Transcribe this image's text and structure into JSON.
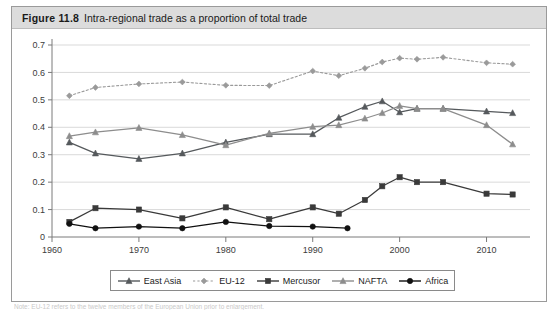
{
  "figure": {
    "label": "Figure 11.8",
    "caption": "Intra-regional trade as a proportion of total trade",
    "footnote": "Note: EU-12 refers to the twelve members of the European Union prior to enlargement."
  },
  "legend": {
    "position": "bottom-center",
    "entries": [
      {
        "label": "East Asia",
        "color": "#55595c",
        "marker": "triangle",
        "dashed": false
      },
      {
        "label": "EU-12",
        "color": "#9a9a9a",
        "marker": "diamond",
        "dashed": true
      },
      {
        "label": "Mercusor",
        "color": "#3a3a3a",
        "marker": "square",
        "dashed": false
      },
      {
        "label": "NAFTA",
        "color": "#8d8d8d",
        "marker": "triangle",
        "dashed": false
      },
      {
        "label": "Africa",
        "color": "#111111",
        "marker": "circle",
        "dashed": false
      }
    ]
  },
  "chart_data": {
    "type": "line",
    "title": "Intra-regional trade as a proportion of total trade",
    "xlabel": "",
    "ylabel": "",
    "xlim": [
      1960,
      2015
    ],
    "ylim": [
      0,
      0.7
    ],
    "ytick_values": [
      0,
      0.1,
      0.2,
      0.3,
      0.4,
      0.5,
      0.6,
      0.7
    ],
    "ytick_labels": [
      "0",
      "0.1",
      "0.2",
      "0.3",
      "0.4",
      "0.5",
      "0.6",
      "0.7"
    ],
    "xtick_values": [
      1960,
      1970,
      1980,
      1990,
      2000,
      2010
    ],
    "xtick_labels": [
      "1960",
      "1970",
      "1980",
      "1990",
      "2000",
      "2010"
    ],
    "grid": "horizontal",
    "series": [
      {
        "name": "East Asia",
        "color": "#55595c",
        "marker": "triangle",
        "dashed": false,
        "x": [
          1962,
          1965,
          1970,
          1975,
          1980,
          1985,
          1990,
          1993,
          1996,
          1998,
          2000,
          2002,
          2005,
          2010,
          2013
        ],
        "y": [
          0.345,
          0.305,
          0.285,
          0.305,
          0.345,
          0.375,
          0.375,
          0.435,
          0.475,
          0.495,
          0.455,
          0.468,
          0.468,
          0.458,
          0.452
        ]
      },
      {
        "name": "EU-12",
        "color": "#9a9a9a",
        "marker": "diamond",
        "dashed": true,
        "x": [
          1962,
          1965,
          1970,
          1975,
          1980,
          1985,
          1990,
          1993,
          1996,
          1998,
          2000,
          2002,
          2005,
          2010,
          2013
        ],
        "y": [
          0.515,
          0.545,
          0.558,
          0.565,
          0.553,
          0.552,
          0.605,
          0.588,
          0.615,
          0.638,
          0.652,
          0.648,
          0.655,
          0.635,
          0.63
        ]
      },
      {
        "name": "Mercusor",
        "color": "#3a3a3a",
        "marker": "square",
        "dashed": false,
        "x": [
          1962,
          1965,
          1970,
          1975,
          1980,
          1985,
          1990,
          1993,
          1996,
          1998,
          2000,
          2002,
          2005,
          2010,
          2013
        ],
        "y": [
          0.055,
          0.105,
          0.1,
          0.068,
          0.108,
          0.065,
          0.108,
          0.085,
          0.135,
          0.185,
          0.218,
          0.2,
          0.2,
          0.158,
          0.155
        ]
      },
      {
        "name": "NAFTA",
        "color": "#8d8d8d",
        "marker": "triangle",
        "dashed": false,
        "x": [
          1962,
          1965,
          1970,
          1975,
          1980,
          1985,
          1990,
          1993,
          1996,
          1998,
          2000,
          2002,
          2005,
          2010,
          2013
        ],
        "y": [
          0.368,
          0.382,
          0.398,
          0.372,
          0.335,
          0.378,
          0.402,
          0.408,
          0.432,
          0.452,
          0.478,
          0.468,
          0.468,
          0.408,
          0.338
        ]
      },
      {
        "name": "Africa",
        "color": "#111111",
        "marker": "circle",
        "dashed": false,
        "x": [
          1962,
          1965,
          1970,
          1975,
          1980,
          1985,
          1990,
          1994
        ],
        "y": [
          0.048,
          0.032,
          0.038,
          0.032,
          0.055,
          0.04,
          0.038,
          0.032
        ]
      }
    ]
  }
}
